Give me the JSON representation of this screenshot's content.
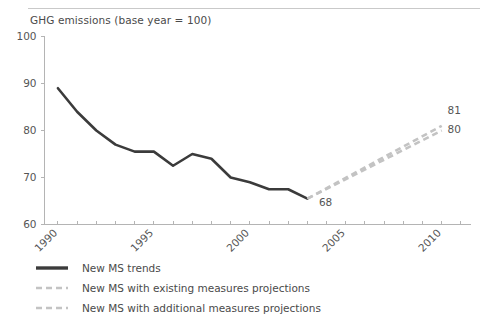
{
  "chart_data": {
    "type": "line",
    "title": "GHG emissions (base year = 100)",
    "xlabel": "",
    "ylabel": "",
    "xlim": [
      1989.3,
      2011.5
    ],
    "ylim": [
      60,
      100
    ],
    "grid": false,
    "legend_position": "bottom-left",
    "ytick_labels": [
      "100",
      "90",
      "80",
      "70",
      "60"
    ],
    "ytick_values": [
      100,
      90,
      80,
      70,
      60
    ],
    "xtick_labels": [
      "1990",
      "1995",
      "2000",
      "2005",
      "2010"
    ],
    "xtick_values": [
      1990,
      1995,
      2000,
      2005,
      2010
    ],
    "xtick_minor_values": [
      1991,
      1992,
      1993,
      1994,
      1996,
      1997,
      1998,
      1999,
      2001,
      2002,
      2003,
      2004,
      2006,
      2007,
      2008,
      2009,
      2011
    ],
    "series": [
      {
        "name": "New MS trends",
        "style": "solid",
        "color": "#3b3b3b",
        "x": [
          1990,
          1991,
          1992,
          1993,
          1994,
          1995,
          1996,
          1997,
          1998,
          1999,
          2000,
          2001,
          2002,
          2003
        ],
        "values": [
          89,
          84,
          80,
          77,
          75.5,
          75.5,
          72.5,
          75,
          74,
          70,
          69,
          67.5,
          67.5,
          65.5
        ]
      },
      {
        "name": "New MS with existing measures projections",
        "style": "dashed",
        "color": "#c3c3c3",
        "x": [
          2003,
          2010
        ],
        "values": [
          65.5,
          80
        ]
      },
      {
        "name": "New MS with additional measures projections",
        "style": "dashed",
        "color": "#c3c3c3",
        "x": [
          2003,
          2010
        ],
        "values": [
          65.5,
          81
        ]
      }
    ],
    "annotations": [
      {
        "text": "68",
        "x": 2003.6,
        "y": 64.0
      },
      {
        "text": "81",
        "x": 2010.3,
        "y": 83.5
      },
      {
        "text": "80",
        "x": 2010.3,
        "y": 79.5
      }
    ]
  },
  "legend": {
    "items": [
      {
        "label": "New MS trends",
        "style": "solid",
        "color": "#3b3b3b"
      },
      {
        "label": "New MS with existing measures projections",
        "style": "dashed",
        "color": "#c3c3c3"
      },
      {
        "label": "New MS with additional measures projections",
        "style": "dashed",
        "color": "#c3c3c3"
      }
    ]
  }
}
